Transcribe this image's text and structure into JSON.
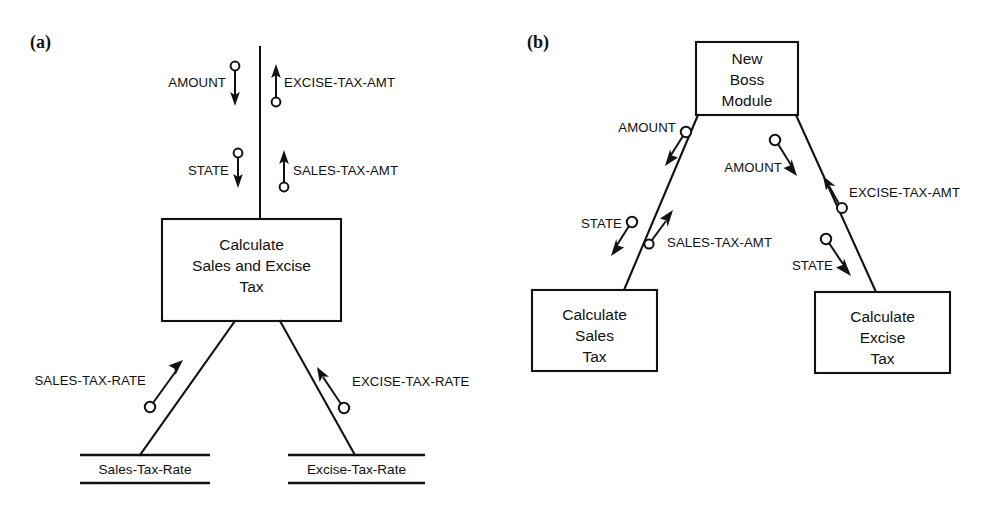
{
  "figure": {
    "panels": [
      {
        "tag": "(a)",
        "modules": [
          {
            "name": "calculate-sales-and-excise-tax",
            "lines": [
              "Calculate",
              "Sales and Excise",
              "Tax"
            ]
          }
        ],
        "data_stores": [
          {
            "name": "sales-tax-rate-store",
            "label": "Sales-Tax-Rate"
          },
          {
            "name": "excise-tax-rate-store",
            "label": "Excise-Tax-Rate"
          }
        ],
        "couples": [
          {
            "name": "amount-in",
            "label": "AMOUNT",
            "direction": "down"
          },
          {
            "name": "excise-tax-amt-out",
            "label": "EXCISE-TAX-AMT",
            "direction": "up"
          },
          {
            "name": "state-in",
            "label": "STATE",
            "direction": "down"
          },
          {
            "name": "sales-tax-amt-out",
            "label": "SALES-TAX-AMT",
            "direction": "up"
          },
          {
            "name": "sales-tax-rate-in",
            "label": "SALES-TAX-RATE",
            "direction": "up-right"
          },
          {
            "name": "excise-tax-rate-in",
            "label": "EXCISE-TAX-RATE",
            "direction": "up-left"
          }
        ]
      },
      {
        "tag": "(b)",
        "modules": [
          {
            "name": "new-boss-module",
            "lines": [
              "New",
              "Boss",
              "Module"
            ]
          },
          {
            "name": "calculate-sales-tax",
            "lines": [
              "Calculate",
              "Sales",
              "Tax"
            ]
          },
          {
            "name": "calculate-excise-tax",
            "lines": [
              "Calculate",
              "Excise",
              "Tax"
            ]
          }
        ],
        "data_stores": [],
        "couples": [
          {
            "name": "amount-to-sales",
            "label": "AMOUNT",
            "direction": "down-left"
          },
          {
            "name": "amount-to-excise",
            "label": "AMOUNT",
            "direction": "down-right"
          },
          {
            "name": "state-to-sales",
            "label": "STATE",
            "direction": "down-left"
          },
          {
            "name": "sales-tax-amt-up",
            "label": "SALES-TAX-AMT",
            "direction": "up-right"
          },
          {
            "name": "excise-tax-amt-up",
            "label": "EXCISE-TAX-AMT",
            "direction": "up-left"
          },
          {
            "name": "state-to-excise",
            "label": "STATE",
            "direction": "down-right"
          }
        ]
      }
    ]
  },
  "colors": {
    "ink": "#111111",
    "paper": "#ffffff"
  }
}
